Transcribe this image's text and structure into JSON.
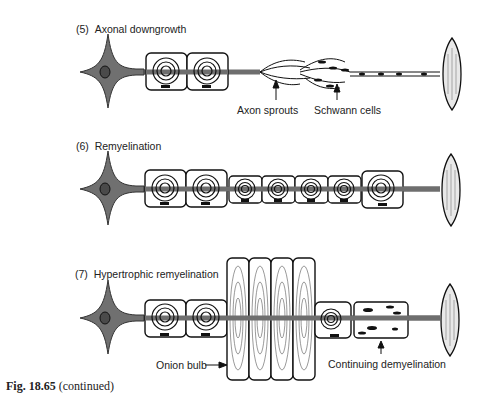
{
  "panels": [
    {
      "number": "(5)",
      "title": "Axonal downgrowth",
      "annotations": [
        "Axon sprouts",
        "Schwann cells"
      ]
    },
    {
      "number": "(6)",
      "title": "Remyelination",
      "annotations": []
    },
    {
      "number": "(7)",
      "title": "Hypertrophic remyelination",
      "annotations": [
        "Onion bulb",
        "Continuing demyelination"
      ]
    }
  ],
  "caption": {
    "figure": "Fig. 18.65",
    "note": "(continued)"
  },
  "colors": {
    "neuron_fill": "#707070",
    "outline": "#111111",
    "axon": "#6e6e6e"
  }
}
